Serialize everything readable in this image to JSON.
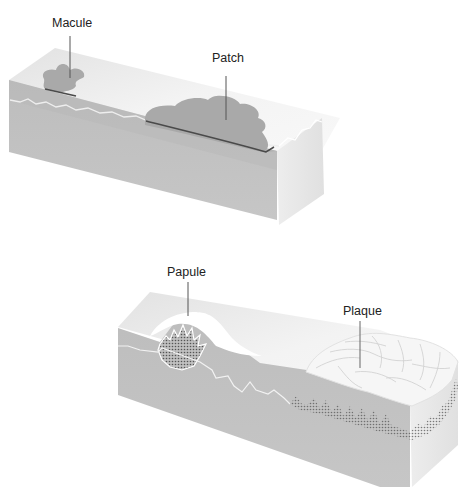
{
  "diagram": {
    "panels": [
      {
        "id": "flat-lesions",
        "labels": [
          {
            "text": "Macule",
            "x": 52,
            "y": 16
          },
          {
            "text": "Patch",
            "x": 212,
            "y": 51
          }
        ]
      },
      {
        "id": "raised-lesions",
        "labels": [
          {
            "text": "Papule",
            "x": 167,
            "y": 265
          },
          {
            "text": "Plaque",
            "x": 343,
            "y": 304
          }
        ]
      }
    ],
    "colors": {
      "skin_top": "#ececec",
      "skin_front": "#bdbdbd",
      "skin_side": "#e6e6e6",
      "lesion": "#a9a9a9",
      "dermal_line": "#eeeeee",
      "leader_line": "#555555"
    }
  }
}
